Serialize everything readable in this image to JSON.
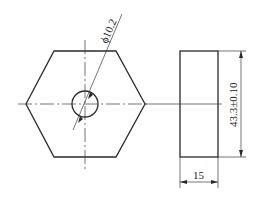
{
  "drawing": {
    "type": "engineering-drawing",
    "views": [
      "front-view-hexagon",
      "side-view-rectangle"
    ],
    "dimensions": {
      "hole_diameter": "ϕ10.2",
      "height": "43.3±0.10",
      "thickness": "15"
    },
    "colors": {
      "line": "#2a2a2a",
      "background": "#ffffff"
    }
  }
}
